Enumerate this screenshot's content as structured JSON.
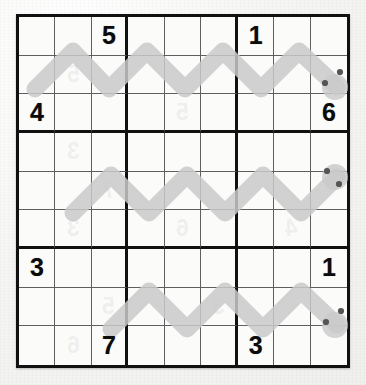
{
  "page": {
    "background_color": "#f4f4f2",
    "paper_color": "#fbfbfa",
    "ink_color": "#0b0b0b",
    "grid_line_color": "#5f5f5f",
    "box_line_color": "#111111",
    "highlighter_color": "#c9c9c9",
    "dot_color": "#555555"
  },
  "grid": {
    "rows": 9,
    "columns": 9,
    "box_size": 3,
    "left": 16,
    "top": 14,
    "width": 334,
    "height": 354,
    "cells": [
      [
        "",
        "",
        "5",
        "",
        "",
        "",
        "1",
        "",
        ""
      ],
      [
        "",
        "",
        "",
        "",
        "",
        "",
        "",
        "",
        ""
      ],
      [
        "4",
        "",
        "",
        "",
        "",
        "",
        "",
        "",
        "6"
      ],
      [
        "",
        "",
        "",
        "",
        "",
        "",
        "",
        "",
        ""
      ],
      [
        "",
        "",
        "",
        "",
        "",
        "",
        "",
        "",
        ""
      ],
      [
        "",
        "",
        "",
        "",
        "",
        "",
        "",
        "",
        ""
      ],
      [
        "3",
        "",
        "",
        "",
        "",
        "",
        "",
        "",
        "1"
      ],
      [
        "",
        "",
        "",
        "",
        "",
        "",
        "",
        "",
        ""
      ],
      [
        "",
        "",
        "7",
        "",
        "",
        "",
        "3",
        "",
        ""
      ]
    ]
  },
  "givens": [
    {
      "row": 1,
      "col": 3,
      "value": "5"
    },
    {
      "row": 1,
      "col": 7,
      "value": "1"
    },
    {
      "row": 3,
      "col": 1,
      "value": "4"
    },
    {
      "row": 3,
      "col": 9,
      "value": "6"
    },
    {
      "row": 7,
      "col": 1,
      "value": "3"
    },
    {
      "row": 7,
      "col": 9,
      "value": "1"
    },
    {
      "row": 9,
      "col": 3,
      "value": "7"
    },
    {
      "row": 9,
      "col": 7,
      "value": "3"
    }
  ],
  "annotations": {
    "description": "Three gray highlighter zigzag strokes drawn across the grid, each terminating at the right edge in a pair of small dark dots.",
    "strokes": [
      {
        "name": "zigzag-top",
        "rows": "1-2",
        "dots": 2
      },
      {
        "name": "zigzag-middle",
        "rows": "4-5",
        "dots": 2
      },
      {
        "name": "zigzag-bottom",
        "rows": "7-8",
        "dots": 2
      }
    ]
  },
  "ghost_digits": [
    {
      "row": 2,
      "col": 2,
      "value": "5"
    },
    {
      "row": 3,
      "col": 5,
      "value": "5"
    },
    {
      "row": 4,
      "col": 2,
      "value": "3"
    },
    {
      "row": 5,
      "col": 3,
      "value": "7"
    },
    {
      "row": 6,
      "col": 2,
      "value": "3"
    },
    {
      "row": 6,
      "col": 5,
      "value": "6"
    },
    {
      "row": 6,
      "col": 8,
      "value": "4"
    },
    {
      "row": 8,
      "col": 3,
      "value": "5"
    },
    {
      "row": 8,
      "col": 6,
      "value": "3"
    },
    {
      "row": 9,
      "col": 2,
      "value": "6"
    }
  ]
}
